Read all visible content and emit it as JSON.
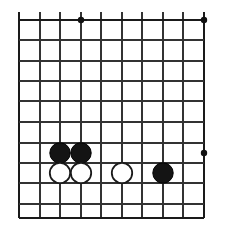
{
  "diagram": {
    "type": "go-board-position",
    "board": {
      "background_color": "#ffffff",
      "line_color": "#333333",
      "edge_line_color": "#1a1a1a",
      "line_width": 1.6,
      "edge_line_width": 2.6,
      "cell_size": 20.4,
      "columns": 10,
      "rows": 11,
      "vertical_line_x": [
        19,
        40,
        60,
        81,
        101,
        122,
        142,
        163,
        183,
        204
      ],
      "horizontal_line_y": [
        20,
        40,
        61,
        81,
        101,
        122,
        143,
        163,
        183,
        204,
        218
      ],
      "vertical_bleed_top_y": 12,
      "left_edge_x": 19,
      "right_edge_x": 204,
      "top_edge_y": 20,
      "bottom_edge_y": 218
    },
    "star_points": {
      "radius": 3.2,
      "color": "#111111",
      "points": [
        {
          "name": "star-point-top-left",
          "x": 81,
          "y": 20
        },
        {
          "name": "star-point-top-right",
          "x": 204,
          "y": 20
        },
        {
          "name": "star-point-right",
          "x": 204,
          "y": 153
        }
      ]
    },
    "stones": {
      "radius": 10.2,
      "black_fill": "#141414",
      "black_stroke": "#000000",
      "white_fill": "#ffffff",
      "white_stroke": "#1a1a1a",
      "white_stroke_width": 1.8,
      "items": [
        {
          "name": "black-stone-1",
          "color": "black",
          "x": 60,
          "y": 153
        },
        {
          "name": "black-stone-2",
          "color": "black",
          "x": 81,
          "y": 153
        },
        {
          "name": "white-stone-1",
          "color": "white",
          "x": 60,
          "y": 173
        },
        {
          "name": "white-stone-2",
          "color": "white",
          "x": 81,
          "y": 173
        },
        {
          "name": "white-stone-3",
          "color": "white",
          "x": 122,
          "y": 173
        },
        {
          "name": "black-stone-3",
          "color": "black",
          "x": 163,
          "y": 173
        }
      ]
    }
  }
}
